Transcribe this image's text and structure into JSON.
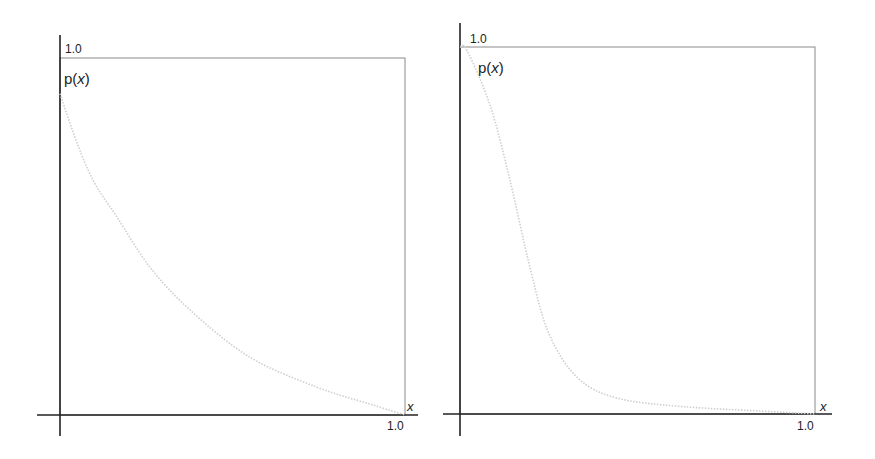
{
  "chart_data": [
    {
      "type": "line",
      "title": "",
      "xlabel": "x",
      "ylabel": "p(x)",
      "xlim": [
        0,
        1.0
      ],
      "ylim": [
        0,
        1.0
      ],
      "x_tick_labels": [
        "1.0"
      ],
      "y_tick_labels": [
        "1.0"
      ],
      "grid": false,
      "legend": null,
      "curve_color": "#cfcfcf",
      "series": [
        {
          "name": "p(x)",
          "x": [
            0.0,
            0.05,
            0.1,
            0.165,
            0.26,
            0.377,
            0.55,
            0.745,
            0.9,
            1.0
          ],
          "y": [
            0.9,
            0.76,
            0.65,
            0.555,
            0.415,
            0.294,
            0.162,
            0.078,
            0.03,
            0.0
          ]
        }
      ]
    },
    {
      "type": "line",
      "title": "",
      "xlabel": "x",
      "ylabel": "p(x)",
      "xlim": [
        0,
        1.0
      ],
      "ylim": [
        0,
        1.0
      ],
      "x_tick_labels": [
        "1.0"
      ],
      "y_tick_labels": [
        "1.0"
      ],
      "grid": false,
      "legend": null,
      "curve_color": "#cfcfcf",
      "series": [
        {
          "name": "p(x)",
          "x": [
            0.0,
            0.02,
            0.085,
            0.14,
            0.197,
            0.25,
            0.33,
            0.44,
            0.63,
            0.91,
            1.0
          ],
          "y": [
            1.0,
            0.99,
            0.84,
            0.64,
            0.4,
            0.22,
            0.1,
            0.044,
            0.02,
            0.005,
            0.0
          ]
        }
      ]
    }
  ],
  "labels": {
    "left": {
      "ytick": "1.0",
      "ylabel": "p(",
      "ylabel_var": "x",
      "ylabel_close": ")",
      "xtick": "1.0",
      "xlabel": "x"
    },
    "right": {
      "ytick": "1.0",
      "ylabel": "p(",
      "ylabel_var": "x",
      "ylabel_close": ")",
      "xtick": "1.0",
      "xlabel": "x"
    }
  }
}
